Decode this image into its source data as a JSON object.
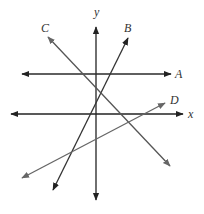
{
  "diagram": {
    "type": "coordinate-plane-lines",
    "axes": {
      "x": {
        "label": "x",
        "color": "#222222",
        "start": [
          11,
          114
        ],
        "end": [
          183,
          114
        ],
        "label_pos": [
          188,
          118
        ]
      },
      "y": {
        "label": "y",
        "color": "#222222",
        "start": [
          96,
          200
        ],
        "end": [
          96,
          27
        ],
        "label_pos": [
          94,
          16
        ]
      }
    },
    "lines": [
      {
        "id": "A",
        "label": "A",
        "color": "#2a2a2a",
        "start": [
          22,
          74
        ],
        "end": [
          171,
          74
        ],
        "arrows": "both",
        "label_pos": [
          175,
          78
        ]
      },
      {
        "id": "B",
        "label": "B",
        "color": "#333333",
        "start": [
          53,
          190
        ],
        "end": [
          128,
          38
        ],
        "arrows": "both",
        "label_pos": [
          124,
          32
        ]
      },
      {
        "id": "C",
        "label": "C",
        "color": "#555555",
        "start": [
          48,
          37
        ],
        "end": [
          170,
          166
        ],
        "arrows": "both",
        "label_pos": [
          41,
          32
        ]
      },
      {
        "id": "D",
        "label": "D",
        "color": "#666666",
        "start": [
          22,
          178
        ],
        "end": [
          165,
          103
        ],
        "arrows": "both",
        "label_pos": [
          170,
          104
        ]
      }
    ]
  }
}
